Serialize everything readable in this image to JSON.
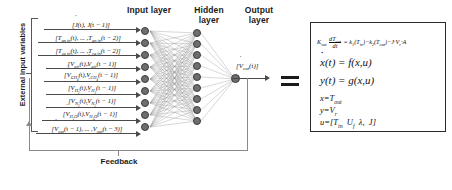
{
  "diagram": {
    "external_label": "External input variables",
    "feedback_label": "Feedback",
    "equals_symbol": "=",
    "layers": [
      {
        "name": "input-layer",
        "label": "Input layer",
        "node_count": 9
      },
      {
        "name": "hidden-layer",
        "label": "Hidden\nlayer",
        "label_line1": "Hidden",
        "label_line2": "layer",
        "node_count": 9
      },
      {
        "name": "output-layer",
        "label": "Output\nlayer",
        "label_line1": "Output",
        "label_line2": "layer",
        "node_count": 1
      }
    ],
    "inputs": [
      {
        "id": "current-density",
        "symbol": "J",
        "dotted": false,
        "text": "[J(t), J(t − 1)]"
      },
      {
        "id": "anode-inlet-temperature",
        "symbol": "T_an,in",
        "dotted": false,
        "text": "[T_an,in(t), ..., T_an,in(t − 2)]"
      },
      {
        "id": "cathode-inlet-temperature",
        "symbol": "T_ca,in",
        "dotted": false,
        "text": "[T_ca,in(t), ..., T_ca,in(t − 2)]"
      },
      {
        "id": "air-flow",
        "symbol": "V_air",
        "dotted": true,
        "text": "[V̇_air(t), V̇_air(t − 1)]"
      },
      {
        "id": "methane-flow",
        "symbol": "V_CH4",
        "dotted": true,
        "text": "[V̇_CH4(t), V̇_CH4(t − 1)]"
      },
      {
        "id": "hydrogen-flow",
        "symbol": "V_H2",
        "dotted": true,
        "text": "[V̇_H2(t), V̇_H2(t − 1)]"
      },
      {
        "id": "nitrogen-flow",
        "symbol": "V_N2",
        "dotted": true,
        "text": "[V̇_N2(t), V̇_N2(t − 1)]"
      },
      {
        "id": "water-flow",
        "symbol": "V_H2O",
        "dotted": true,
        "text": "[V̇_H2O(t), V̇_H2O(t − 1)]"
      },
      {
        "id": "output-feedback",
        "symbol": "V_out",
        "dotted": true,
        "text": "[V̇_out(t − 1), ..., V̇_out(t − 3)]"
      }
    ],
    "output_signal": {
      "id": "network-output",
      "text": "[V̇_out(t)]"
    },
    "equations": [
      {
        "id": "energy-balance",
        "text": "K_out · dT_out/dt = k₁(T_in) − k₂(T_out) − J · V_r · A"
      },
      {
        "id": "state-equation",
        "text": "ẋ(t) = f(x,u)"
      },
      {
        "id": "output-equation",
        "text": "y(t) = g(x,u)"
      },
      {
        "id": "state-definition",
        "text": "x = T_out"
      },
      {
        "id": "output-definition",
        "text": "y = V_r"
      },
      {
        "id": "input-definition",
        "text": "u = [T_in  U_f  λ  J]"
      }
    ]
  },
  "colors": {
    "node_fill": "#6e6e6e",
    "node_stroke": "#3d3d3d",
    "wire": "#7a7a7a",
    "arrow": "#4a4a4a",
    "text": "#1a1a1a",
    "box_border": "#2b2b2b",
    "background": "#ffffff"
  }
}
